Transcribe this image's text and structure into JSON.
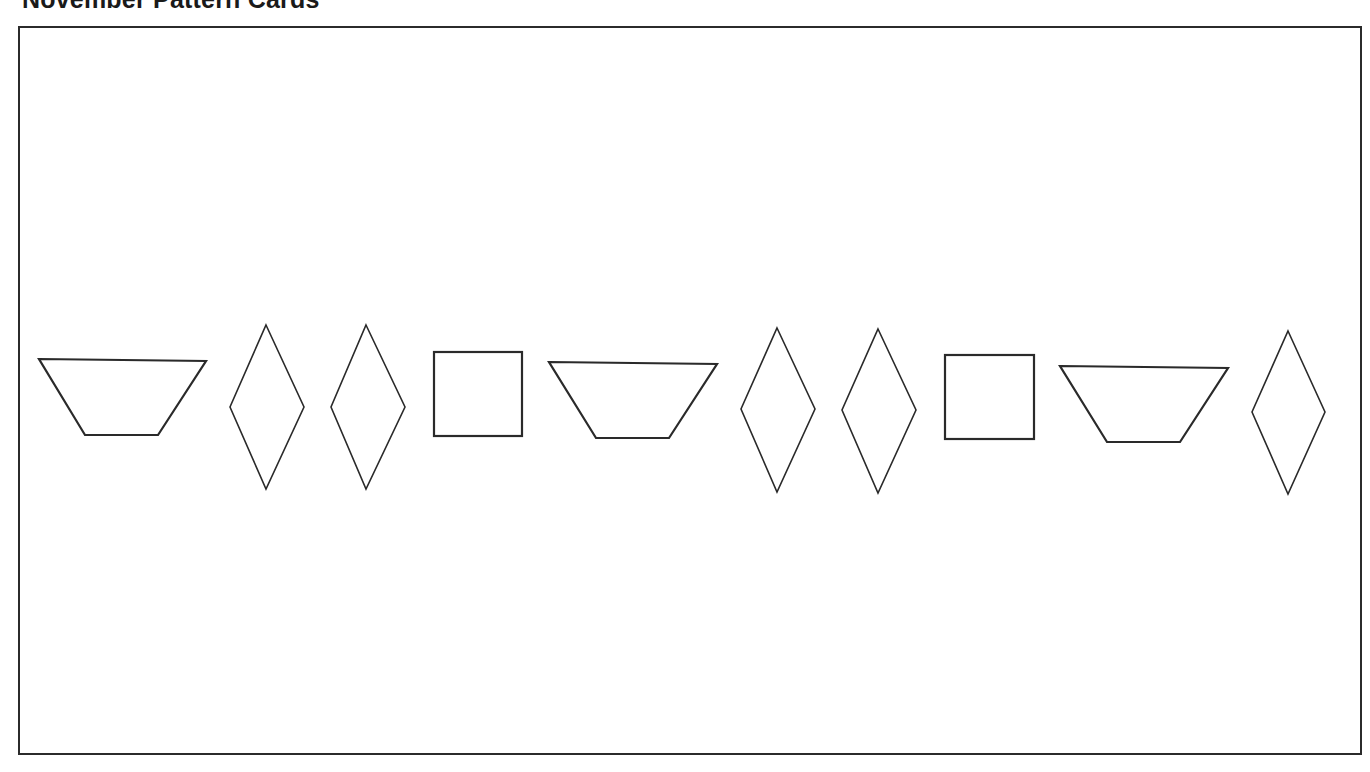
{
  "page": {
    "title": "November Pattern Cards"
  },
  "card": {
    "pattern_unit": [
      "trapezoid",
      "rhombus",
      "rhombus",
      "square"
    ],
    "shapes": [
      {
        "type": "trapezoid",
        "label": "red trapezoid",
        "points": "39,359 206,361 158,435 85,435"
      },
      {
        "type": "rhombus",
        "label": "blue rhombus",
        "points": "266,325 304,407 266,489 230,407"
      },
      {
        "type": "rhombus",
        "label": "blue rhombus",
        "points": "366,325 405,407 366,489 331,407"
      },
      {
        "type": "square",
        "label": "orange square",
        "x": 434,
        "y": 352,
        "w": 88,
        "h": 84
      },
      {
        "type": "trapezoid",
        "label": "red trapezoid",
        "points": "549,362 717,364 669,438 596,438"
      },
      {
        "type": "rhombus",
        "label": "blue rhombus",
        "points": "777,328 815,409 777,492 741,409"
      },
      {
        "type": "rhombus",
        "label": "blue rhombus",
        "points": "878,329 916,410 878,493 842,410"
      },
      {
        "type": "square",
        "label": "orange square",
        "x": 945,
        "y": 355,
        "w": 89,
        "h": 84
      },
      {
        "type": "trapezoid",
        "label": "red trapezoid",
        "points": "1060,366 1228,368 1180,442 1107,442"
      },
      {
        "type": "rhombus",
        "label": "blue rhombus",
        "points": "1288,331 1325,412 1288,494 1252,412"
      }
    ]
  },
  "colors": {
    "stroke": "#2a2a2a",
    "frame": "#2b2b2b",
    "background": "#ffffff",
    "title": "#1a1a1a"
  }
}
